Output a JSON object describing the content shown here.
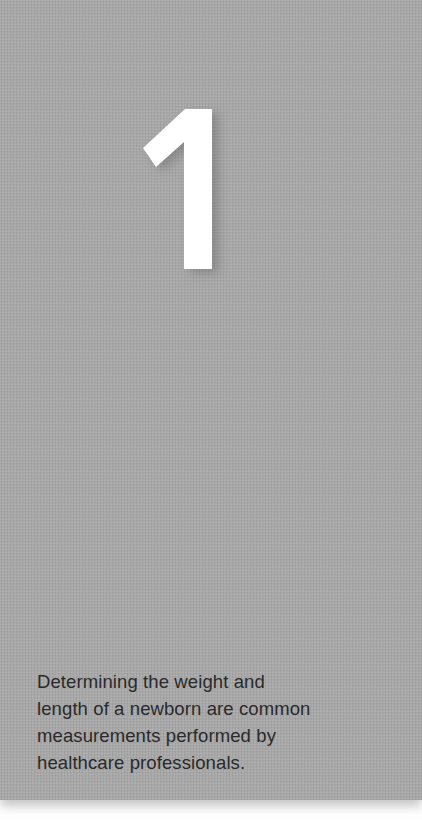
{
  "panel": {
    "background_color": "#a9a9a9",
    "number": "1",
    "number_color": "#ffffff",
    "caption_lines": [
      "Determining the weight and",
      "length of a newborn are common",
      "measurements performed by",
      "healthcare professionals."
    ],
    "caption_color": "#2a2a2a"
  }
}
